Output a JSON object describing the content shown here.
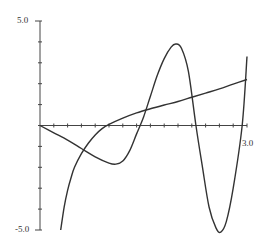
{
  "chart_data": {
    "type": "line",
    "title": "",
    "xlabel": "",
    "ylabel": "",
    "xlim": [
      0,
      3.0
    ],
    "ylim": [
      -5.0,
      5.0
    ],
    "x_tick_step": 0.2,
    "y_tick_step": 1.0,
    "tick_labels": {
      "y_max": "5.0",
      "y_min": "-5.0",
      "x_max": "3.0"
    },
    "grid": false,
    "legend": null,
    "series": [
      {
        "name": "smooth increasing curve",
        "x": [
          0.3,
          0.35,
          0.4,
          0.45,
          0.5,
          0.6,
          0.7,
          0.8,
          0.9,
          1.0,
          1.2,
          1.4,
          1.6,
          1.8,
          2.0,
          2.2,
          2.4,
          2.6,
          2.8,
          3.0
        ],
        "y": [
          -5.0,
          -3.9,
          -3.1,
          -2.5,
          -2.0,
          -1.35,
          -0.85,
          -0.45,
          -0.15,
          0.05,
          0.35,
          0.6,
          0.8,
          0.98,
          1.15,
          1.35,
          1.55,
          1.75,
          1.98,
          2.2
        ]
      },
      {
        "name": "oscillating curve",
        "x": [
          0.0,
          0.2,
          0.4,
          0.6,
          0.8,
          1.0,
          1.1,
          1.2,
          1.3,
          1.4,
          1.5,
          1.6,
          1.7,
          1.8,
          1.9,
          1.97,
          2.05,
          2.15,
          2.26,
          2.35,
          2.45,
          2.55,
          2.62,
          2.7,
          2.8,
          2.93,
          3.0
        ],
        "y": [
          0.0,
          -0.35,
          -0.7,
          -1.1,
          -1.5,
          -1.8,
          -1.85,
          -1.7,
          -1.2,
          -0.4,
          0.4,
          1.4,
          2.4,
          3.2,
          3.75,
          3.9,
          3.7,
          2.6,
          0.0,
          -1.9,
          -3.9,
          -4.9,
          -5.1,
          -4.6,
          -3.0,
          0.0,
          3.3
        ]
      }
    ]
  }
}
